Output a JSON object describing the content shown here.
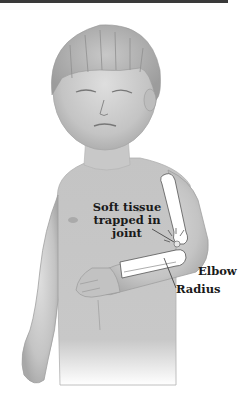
{
  "figure": {
    "colors": {
      "background": "#ffffff",
      "skin_shade": "#c8c8c8",
      "skin_dark": "#9a9a9a",
      "bone": "#ffffff",
      "outline": "#555555",
      "text": "#1a1a1a",
      "top_bar": "#3a3a3a"
    },
    "labels": {
      "soft_tissue": [
        "Soft tissue",
        "trapped in",
        "joint"
      ],
      "elbow": "Elbow",
      "radius": "Radius"
    }
  }
}
